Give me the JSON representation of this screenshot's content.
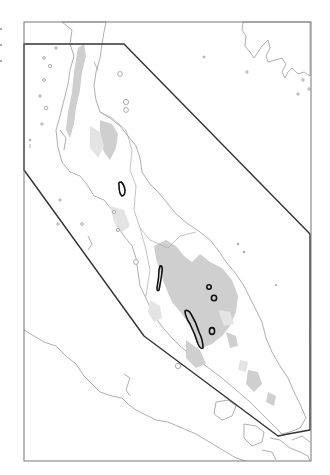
{
  "map": {
    "title": "",
    "colors": {
      "background": "#ffffff",
      "frame": "#777777",
      "coastline": "#9a9a9a",
      "highland_relief": "#cfcfcf",
      "study_area_boundary": "#333333",
      "site_outline": "#111111"
    },
    "frame": {
      "x": 24,
      "y": 22,
      "width": 287,
      "height": 439
    },
    "study_area_polygon": [
      [
        24,
        44
      ],
      [
        124,
        44
      ],
      [
        310,
        234
      ],
      [
        310,
        430
      ],
      [
        288,
        434
      ],
      [
        278,
        436
      ],
      [
        144,
        336
      ],
      [
        24,
        170
      ]
    ],
    "features": [
      {
        "type": "landmass",
        "name": "peninsula",
        "shading": "highland relief in grey"
      },
      {
        "type": "site-outline",
        "shape": "elongated",
        "approx_position": [
          122,
          190
        ]
      },
      {
        "type": "site-outline",
        "shape": "elongated",
        "approx_position": [
          161,
          277
        ]
      },
      {
        "type": "site-outline",
        "shape": "elongated",
        "approx_position": [
          191,
          331
        ]
      },
      {
        "type": "site-outline",
        "shape": "small-circle",
        "approx_position": [
          209,
          287
        ]
      },
      {
        "type": "site-outline",
        "shape": "small-circle",
        "approx_position": [
          214,
          298
        ]
      },
      {
        "type": "site-outline",
        "shape": "small-oval",
        "approx_position": [
          212,
          331
        ]
      }
    ],
    "labels": []
  }
}
